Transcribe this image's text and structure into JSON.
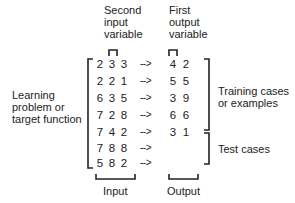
{
  "labels": {
    "second_input": [
      "Second",
      "input",
      "variable"
    ],
    "first_output": [
      "First",
      "output",
      "variable"
    ],
    "learning": [
      "Learning",
      "problem or",
      "target function"
    ],
    "training": [
      "Training cases",
      "or examples"
    ],
    "test": "Test cases",
    "input": "Input",
    "output": "Output"
  },
  "arrow": "-->",
  "rows": [
    {
      "inputs": [
        "2",
        "3",
        "3"
      ],
      "outputs": [
        "4",
        "2"
      ]
    },
    {
      "inputs": [
        "2",
        "2",
        "1"
      ],
      "outputs": [
        "5",
        "5"
      ]
    },
    {
      "inputs": [
        "6",
        "3",
        "5"
      ],
      "outputs": [
        "3",
        "9"
      ]
    },
    {
      "inputs": [
        "7",
        "2",
        "8"
      ],
      "outputs": [
        "6",
        "6"
      ]
    },
    {
      "inputs": [
        "7",
        "4",
        "2"
      ],
      "outputs": [
        "3",
        "1"
      ]
    },
    {
      "inputs": [
        "7",
        "8",
        "8"
      ],
      "outputs": [
        "",
        ""
      ]
    },
    {
      "inputs": [
        "5",
        "8",
        "2"
      ],
      "outputs": [
        "",
        ""
      ]
    }
  ]
}
